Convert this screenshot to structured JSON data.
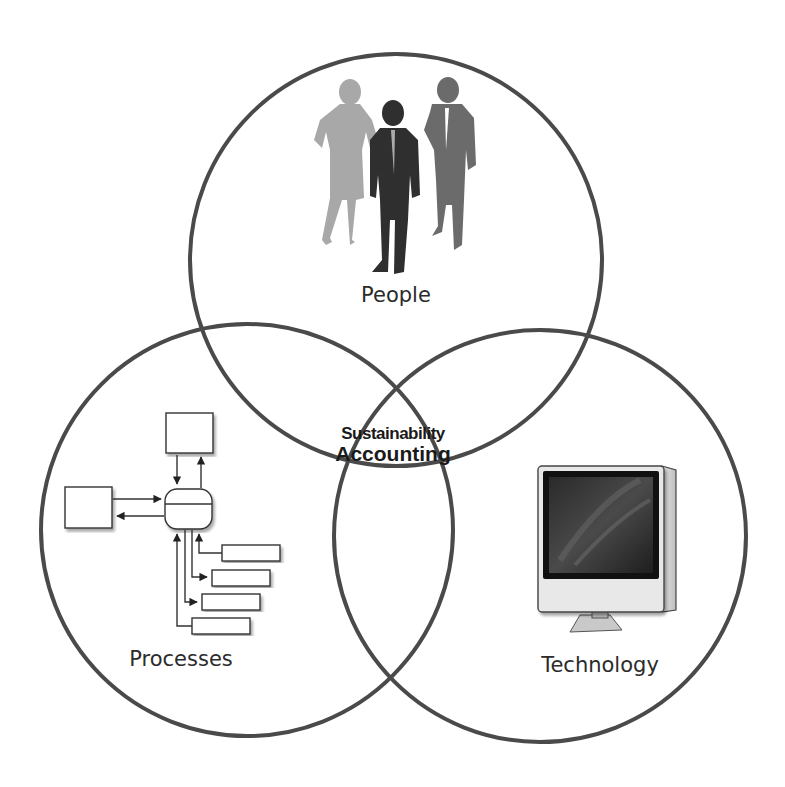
{
  "diagram": {
    "type": "venn",
    "center_label": {
      "line1": "Sustainability",
      "line2": "Accounting"
    },
    "circles": [
      {
        "id": "people",
        "label": "People",
        "icon": "people-silhouettes-icon"
      },
      {
        "id": "processes",
        "label": "Processes",
        "icon": "process-flow-diagram-icon"
      },
      {
        "id": "technology",
        "label": "Technology",
        "icon": "desktop-computer-icon"
      }
    ],
    "colors": {
      "circle_stroke": "#4a4a4a",
      "background": "#ffffff",
      "text": "#2b2b2b"
    }
  }
}
